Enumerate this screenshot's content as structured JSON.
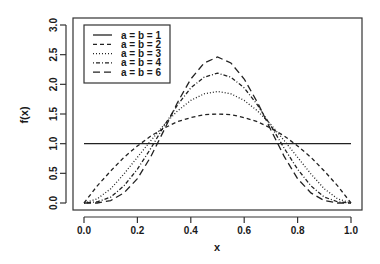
{
  "chart_data": {
    "type": "line",
    "title": "",
    "xlabel": "x",
    "ylabel": "f(x)",
    "xlim": [
      0.0,
      1.0
    ],
    "ylim": [
      0.0,
      3.0
    ],
    "grid": false,
    "legend_position": "top-left",
    "x_ticks": [
      "0.0",
      "0.2",
      "0.4",
      "0.6",
      "0.8",
      "1.0"
    ],
    "y_ticks": [
      "0.0",
      "0.5",
      "1.0",
      "1.5",
      "2.0",
      "2.5",
      "3.0"
    ],
    "x": [
      0.0,
      0.05,
      0.1,
      0.15,
      0.2,
      0.25,
      0.3,
      0.35,
      0.4,
      0.45,
      0.5,
      0.55,
      0.6,
      0.65,
      0.7,
      0.75,
      0.8,
      0.85,
      0.9,
      0.95,
      1.0
    ],
    "series": [
      {
        "name": "a = b = 1",
        "dash": "",
        "values": [
          1,
          1,
          1,
          1,
          1,
          1,
          1,
          1,
          1,
          1,
          1,
          1,
          1,
          1,
          1,
          1,
          1,
          1,
          1,
          1,
          1
        ]
      },
      {
        "name": "a = b = 2",
        "dash": "4,3",
        "values": [
          0,
          0.29,
          0.54,
          0.77,
          0.96,
          1.13,
          1.26,
          1.37,
          1.44,
          1.49,
          1.5,
          1.49,
          1.44,
          1.37,
          1.26,
          1.13,
          0.96,
          0.77,
          0.54,
          0.29,
          0
        ]
      },
      {
        "name": "a = b = 3",
        "dash": "1,2",
        "values": [
          0,
          0.07,
          0.24,
          0.49,
          0.77,
          1.05,
          1.32,
          1.55,
          1.73,
          1.84,
          1.88,
          1.84,
          1.73,
          1.55,
          1.32,
          1.05,
          0.77,
          0.49,
          0.24,
          0.07,
          0
        ]
      },
      {
        "name": "a = b = 4",
        "dash": "1,2,4,2",
        "values": [
          0,
          0.02,
          0.1,
          0.29,
          0.57,
          0.92,
          1.3,
          1.65,
          1.94,
          2.12,
          2.19,
          2.12,
          1.94,
          1.65,
          1.3,
          0.92,
          0.57,
          0.29,
          0.1,
          0.02,
          0
        ]
      },
      {
        "name": "a = b = 6",
        "dash": "7,4",
        "values": [
          0,
          0.0,
          0.04,
          0.17,
          0.41,
          0.78,
          1.23,
          1.69,
          2.09,
          2.36,
          2.46,
          2.36,
          2.09,
          1.69,
          1.23,
          0.78,
          0.41,
          0.17,
          0.04,
          0.0,
          0
        ]
      }
    ]
  }
}
